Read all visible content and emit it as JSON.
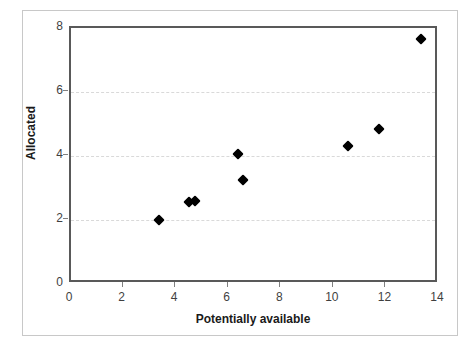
{
  "chart_data": {
    "type": "scatter",
    "title": "",
    "xlabel": "Potentially available",
    "ylabel": "Allocated",
    "xlim": [
      0,
      14
    ],
    "ylim": [
      0,
      8
    ],
    "xticks": [
      0,
      2,
      4,
      6,
      8,
      10,
      12,
      14
    ],
    "yticks": [
      0,
      2,
      4,
      6,
      8
    ],
    "xtick_labels": [
      "0",
      "2",
      "4",
      "6",
      "8",
      "10",
      "12",
      "14"
    ],
    "ytick_labels": [
      "0",
      "2",
      "4",
      "6",
      "8"
    ],
    "grid": "horizontal-dashed",
    "gridlines_y": [
      2,
      4,
      6
    ],
    "legend": "none",
    "marker": "diamond",
    "marker_color": "#000000",
    "points": [
      {
        "x": 3.35,
        "y": 2.0
      },
      {
        "x": 4.5,
        "y": 2.55
      },
      {
        "x": 4.7,
        "y": 2.58
      },
      {
        "x": 6.35,
        "y": 4.05
      },
      {
        "x": 6.55,
        "y": 3.25
      },
      {
        "x": 10.55,
        "y": 4.3
      },
      {
        "x": 11.7,
        "y": 4.85
      },
      {
        "x": 13.3,
        "y": 7.65
      }
    ]
  },
  "colors": {
    "axis": "#595959",
    "gridline": "#d9d9d9",
    "tick_text": "#3f3f3f",
    "axis_title": "#1a1a1a",
    "frame": "#c8c8c8",
    "background": "#ffffff"
  }
}
